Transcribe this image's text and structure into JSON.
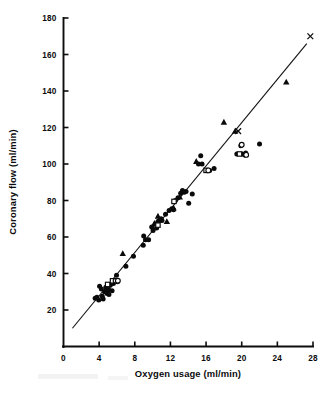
{
  "chart_data": {
    "type": "scatter",
    "title": "",
    "xlabel": "Oxygen usage (ml/min)",
    "ylabel": "Coronary flow (ml/min)",
    "xlim": [
      0,
      28
    ],
    "ylim": [
      0,
      180
    ],
    "xticks": [
      0,
      4,
      8,
      12,
      16,
      20,
      24,
      28
    ],
    "yticks": [
      20,
      40,
      60,
      80,
      100,
      120,
      140,
      160,
      180
    ],
    "xtick_labels": [
      "0",
      "4",
      "8",
      "12",
      "16",
      "20",
      "24",
      "28"
    ],
    "ytick_labels": [
      "20",
      "40",
      "60",
      "80",
      "100",
      "120",
      "140",
      "160",
      "180"
    ],
    "grid": false,
    "legend": false,
    "legend_position": "none",
    "fit_line": {
      "label": "regression line",
      "x_start": 1.0,
      "y_start": 10.0,
      "x_end": 27.3,
      "y_end": 166.0
    },
    "series": [
      {
        "name": "filled circle",
        "marker": "filled-circle",
        "points": [
          [
            3.55,
            26.5
          ],
          [
            3.75,
            27.0
          ],
          [
            3.95,
            25.5
          ],
          [
            4.05,
            33.0
          ],
          [
            4.25,
            31.5
          ],
          [
            4.35,
            27.5
          ],
          [
            4.45,
            26.0
          ],
          [
            4.6,
            30.0
          ],
          [
            4.75,
            32.5
          ],
          [
            4.9,
            29.0
          ],
          [
            5.0,
            31.0
          ],
          [
            5.1,
            28.5
          ],
          [
            5.25,
            33.5
          ],
          [
            5.45,
            30.5
          ],
          [
            5.6,
            34.5
          ],
          [
            5.95,
            39.0
          ],
          [
            6.05,
            35.5
          ],
          [
            7.0,
            44.0
          ],
          [
            7.85,
            49.5
          ],
          [
            8.95,
            55.5
          ],
          [
            9.0,
            60.5
          ],
          [
            9.2,
            58.5
          ],
          [
            9.55,
            58.5
          ],
          [
            9.9,
            65.5
          ],
          [
            10.05,
            63.5
          ],
          [
            10.3,
            67.0
          ],
          [
            10.45,
            65.0
          ],
          [
            10.6,
            68.5
          ],
          [
            10.75,
            69.0
          ],
          [
            10.95,
            70.0
          ],
          [
            11.05,
            69.0
          ],
          [
            11.45,
            72.5
          ],
          [
            11.85,
            74.5
          ],
          [
            12.15,
            75.5
          ],
          [
            12.35,
            75.0
          ],
          [
            12.55,
            80.0
          ],
          [
            12.85,
            81.5
          ],
          [
            13.15,
            84.0
          ],
          [
            13.35,
            85.5
          ],
          [
            13.55,
            84.5
          ],
          [
            13.75,
            85.0
          ],
          [
            14.05,
            78.5
          ],
          [
            14.45,
            83.5
          ],
          [
            15.15,
            100.0
          ],
          [
            15.4,
            104.5
          ],
          [
            15.55,
            100.0
          ],
          [
            16.4,
            96.5
          ],
          [
            16.9,
            97.5
          ],
          [
            19.45,
            105.5
          ],
          [
            19.9,
            110.0
          ],
          [
            20.05,
            105.5
          ],
          [
            20.35,
            105.0
          ],
          [
            20.45,
            106.0
          ],
          [
            22.0,
            111.0
          ]
        ]
      },
      {
        "name": "filled triangle",
        "marker": "triangle",
        "points": [
          [
            4.9,
            32.0
          ],
          [
            5.15,
            31.5
          ],
          [
            6.65,
            51.0
          ],
          [
            10.2,
            67.5
          ],
          [
            10.6,
            71.5
          ],
          [
            11.6,
            68.5
          ],
          [
            12.35,
            76.0
          ],
          [
            13.05,
            82.0
          ],
          [
            14.9,
            101.5
          ],
          [
            18.0,
            123.0
          ],
          [
            19.25,
            118.0
          ],
          [
            25.0,
            145.0
          ]
        ]
      },
      {
        "name": "open square",
        "marker": "open-square",
        "points": [
          [
            4.95,
            34.0
          ],
          [
            5.5,
            36.0
          ],
          [
            10.6,
            66.5
          ],
          [
            12.4,
            79.5
          ],
          [
            16.0,
            96.5
          ],
          [
            19.75,
            105.5
          ]
        ]
      },
      {
        "name": "open circle",
        "marker": "open-circle",
        "points": [
          [
            5.85,
            36.0
          ],
          [
            6.1,
            36.0
          ],
          [
            16.25,
            96.5
          ],
          [
            20.0,
            110.5
          ],
          [
            20.5,
            105.0
          ]
        ]
      },
      {
        "name": "cross",
        "marker": "cross",
        "points": [
          [
            19.6,
            118.0
          ],
          [
            27.7,
            170.0
          ]
        ]
      }
    ]
  },
  "figure": {
    "caption_fragment": ""
  }
}
